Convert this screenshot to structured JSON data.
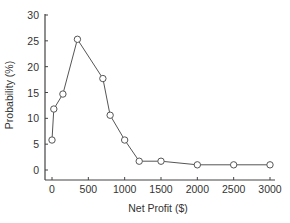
{
  "chart_data": {
    "type": "line",
    "title": "",
    "xlabel": "Net Profit ($)",
    "ylabel": "Probability (%)",
    "xlim": [
      -60,
      3100
    ],
    "ylim": [
      -2,
      30
    ],
    "xticks": [
      0,
      500,
      1000,
      1500,
      2000,
      2500,
      3000
    ],
    "yticks": [
      0,
      5,
      10,
      15,
      20,
      25,
      30
    ],
    "grid": false,
    "legend": null,
    "marker": "open-circle",
    "series": [
      {
        "name": "Probability",
        "x": [
          0,
          25,
          150,
          350,
          700,
          800,
          1000,
          1200,
          1500,
          2000,
          2500,
          3000
        ],
        "y": [
          5.8,
          11.8,
          14.7,
          25.3,
          17.7,
          10.6,
          5.8,
          1.7,
          1.7,
          1.0,
          1.0,
          1.0
        ]
      }
    ],
    "colors": {
      "line": "#555555",
      "axis": "#444444",
      "text": "#333333"
    }
  }
}
